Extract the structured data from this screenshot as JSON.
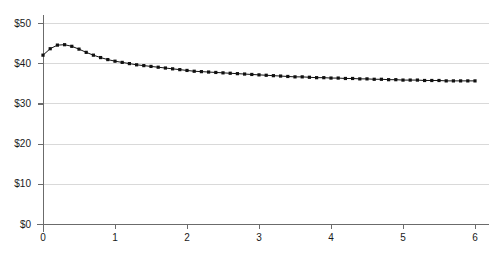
{
  "chart_data": {
    "type": "line",
    "title": "",
    "subtitle": "",
    "xlabel": "",
    "ylabel": "",
    "xlim": [
      0,
      6
    ],
    "ylim": [
      0,
      50
    ],
    "grid": true,
    "legend": "none",
    "y_tick_labels": [
      "$0",
      "$10",
      "$20",
      "$30",
      "$40",
      "$50"
    ],
    "y_tick_values": [
      0,
      10,
      20,
      30,
      40,
      50
    ],
    "x_tick_labels": [
      "0",
      "1",
      "2",
      "3",
      "4",
      "5",
      "6"
    ],
    "x_tick_values": [
      0,
      1,
      2,
      3,
      4,
      5,
      6
    ],
    "marker": "square",
    "marker_color": "#111111",
    "line_color": "#111111",
    "grid_color": "#d9d9d9",
    "axis_color": "#6b6b6b",
    "series": [
      {
        "name": "value",
        "x": [
          0,
          0.1,
          0.2,
          0.3,
          0.4,
          0.5,
          0.6,
          0.7,
          0.8,
          0.9,
          1.0,
          1.1,
          1.2,
          1.3,
          1.4,
          1.5,
          1.6,
          1.7,
          1.8,
          1.9,
          2.0,
          2.1,
          2.2,
          2.3,
          2.4,
          2.5,
          2.6,
          2.7,
          2.8,
          2.9,
          3.0,
          3.1,
          3.2,
          3.3,
          3.4,
          3.5,
          3.6,
          3.7,
          3.8,
          3.9,
          4.0,
          4.1,
          4.2,
          4.3,
          4.4,
          4.5,
          4.6,
          4.7,
          4.8,
          4.9,
          5.0,
          5.1,
          5.2,
          5.3,
          5.4,
          5.5,
          5.6,
          5.7,
          5.8,
          5.9,
          6.0
        ],
        "values": [
          42.0,
          43.6,
          44.5,
          44.6,
          44.2,
          43.5,
          42.7,
          42.0,
          41.4,
          40.9,
          40.5,
          40.2,
          39.9,
          39.6,
          39.4,
          39.2,
          39.0,
          38.8,
          38.6,
          38.4,
          38.2,
          38.0,
          37.9,
          37.8,
          37.7,
          37.6,
          37.5,
          37.4,
          37.3,
          37.2,
          37.1,
          37.0,
          36.9,
          36.8,
          36.7,
          36.6,
          36.6,
          36.5,
          36.4,
          36.4,
          36.3,
          36.3,
          36.2,
          36.2,
          36.1,
          36.1,
          36.0,
          36.0,
          35.9,
          35.9,
          35.8,
          35.8,
          35.8,
          35.7,
          35.7,
          35.7,
          35.6,
          35.6,
          35.6,
          35.6,
          35.6
        ]
      }
    ]
  }
}
